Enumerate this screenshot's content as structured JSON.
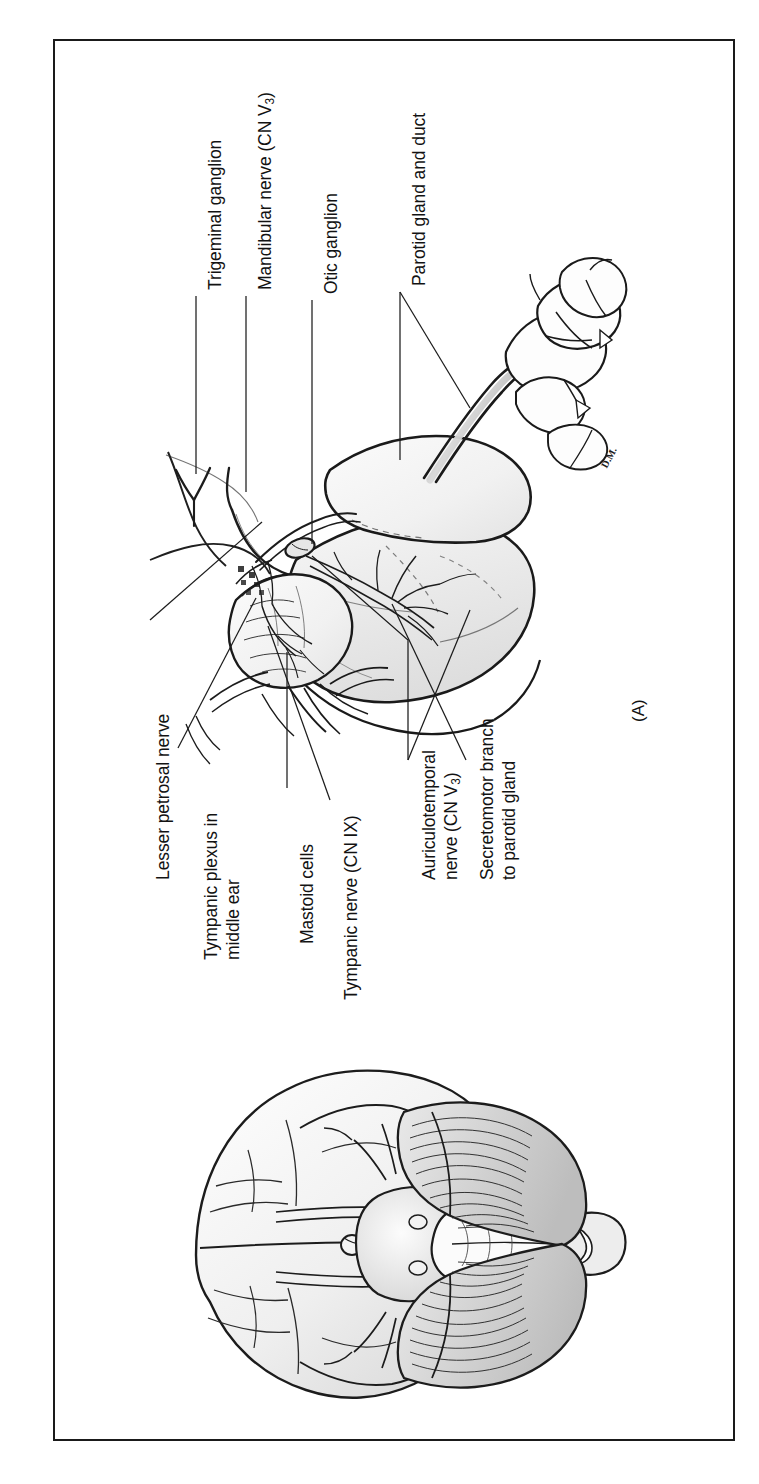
{
  "figure": {
    "panel_letter": "(A)",
    "artist_signature": "D.M.",
    "frame_color": "#1a1a1a",
    "background_color": "#ffffff",
    "ink_color": "#121212",
    "orientation_note": "labels rotated 90 degrees counter-clockwise"
  },
  "labels": [
    {
      "id": "trigeminal-ganglion",
      "text": "Trigeminal ganglion"
    },
    {
      "id": "mandibular-nerve",
      "text_before": "Mandibular nerve (CN V",
      "subscript": "3",
      "text_after": ")"
    },
    {
      "id": "otic-ganglion",
      "text": "Otic ganglion"
    },
    {
      "id": "parotid-gland-and-duct",
      "text": "Parotid gland and duct"
    },
    {
      "id": "lesser-petrosal-nerve",
      "text": "Lesser petrosal nerve"
    },
    {
      "id": "tympanic-plexus",
      "line1": "Tympanic plexus in",
      "line2": "middle ear"
    },
    {
      "id": "mastoid-cells",
      "text": "Mastoid cells"
    },
    {
      "id": "tympanic-nerve",
      "text": "Tympanic nerve (CN IX)"
    },
    {
      "id": "auriculotemporal-nerve",
      "line1": "Auriculotemporal",
      "text_before": "nerve (CN V",
      "subscript": "3",
      "text_after": ")"
    },
    {
      "id": "secretomotor-branch",
      "line1": "Secretomotor branch",
      "line2": "to parotid gland"
    }
  ],
  "structures": {
    "upper_illustration": "Lateral dissection of temporal bone, middle ear, otic ganglion and parotid gland with duct overlying molar teeth",
    "lower_illustration": "Inferior (ventral) view of the brain showing cerebral hemispheres, cranial nerves, brainstem and cerebellum"
  }
}
